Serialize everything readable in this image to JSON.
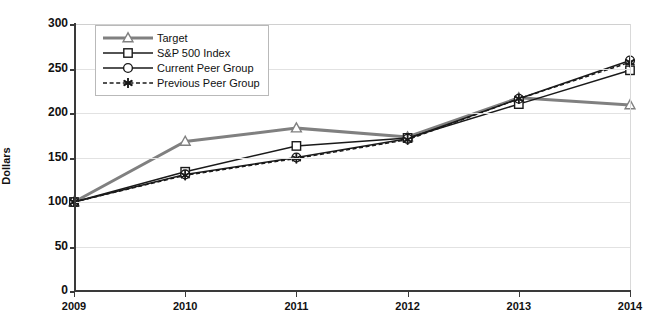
{
  "chart_data": {
    "type": "line",
    "title": "",
    "xlabel": "",
    "ylabel": "Dollars",
    "ylim": [
      0,
      300
    ],
    "yticks": [
      0,
      50,
      100,
      150,
      200,
      250,
      300
    ],
    "categories": [
      "2009",
      "2010",
      "2011",
      "2012",
      "2013",
      "2014"
    ],
    "grid": "horizontal",
    "legend_position": "top-left",
    "series": [
      {
        "name": "Target",
        "marker": "triangle",
        "line_style": "solid",
        "color": "#808080",
        "values": [
          100,
          168,
          183,
          173,
          217,
          209
        ]
      },
      {
        "name": "S&P 500 Index",
        "marker": "square",
        "line_style": "solid",
        "color": "#1a1a1a",
        "values": [
          100,
          134,
          163,
          172,
          210,
          248
        ]
      },
      {
        "name": "Current Peer Group",
        "marker": "circle",
        "line_style": "solid",
        "color": "#1a1a1a",
        "values": [
          100,
          131,
          150,
          171,
          216,
          259
        ]
      },
      {
        "name": "Previous Peer Group",
        "marker": "star",
        "line_style": "dashed",
        "color": "#1a1a1a",
        "values": [
          100,
          130,
          149,
          170,
          216,
          257
        ]
      }
    ]
  },
  "colors": {
    "axis": "#3a3a3a",
    "gridline": "#e2e2e2",
    "background": "#ffffff",
    "text": "#111111"
  }
}
